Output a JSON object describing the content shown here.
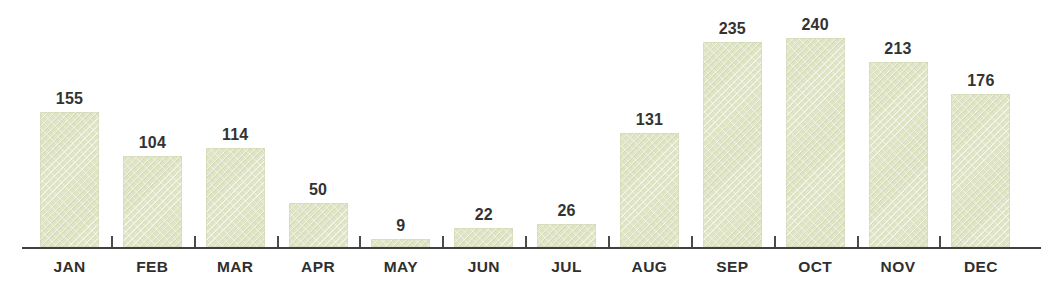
{
  "chart_data": {
    "type": "bar",
    "title": "",
    "subtitle": "",
    "xlabel": "",
    "ylabel": "",
    "categories": [
      "JAN",
      "FEB",
      "MAR",
      "APR",
      "MAY",
      "JUN",
      "JUL",
      "AUG",
      "SEP",
      "OCT",
      "NOV",
      "DEC"
    ],
    "values": [
      155,
      104,
      114,
      50,
      9,
      22,
      26,
      131,
      235,
      240,
      213,
      176
    ],
    "value_labels": [
      "155",
      "104",
      "114",
      "50",
      "9",
      "22",
      "26",
      "131",
      "235",
      "240",
      "213",
      "176"
    ],
    "ylim": [
      0,
      240
    ],
    "grid": false,
    "legend": false,
    "legend_position": "none",
    "annotations": [],
    "axis": {
      "show_x_axis_line": true,
      "show_y_axis_line": false,
      "tick_marks_between_categories": true,
      "y_tick_labels": []
    },
    "colors": {
      "bar_fill": "#dfe4c5",
      "bar_edge": "#cdd4ae",
      "axis_line": "#3f4040",
      "tick": "#4a4b4b",
      "value_label_text": "#333333",
      "category_label_text": "#2f2f2f",
      "background": "#ffffff"
    }
  }
}
